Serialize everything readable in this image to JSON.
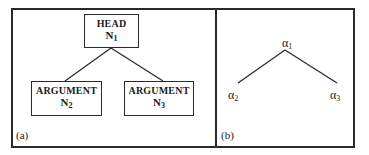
{
  "panel_a": {
    "label": "(a)",
    "head": {
      "title": "HEAD",
      "node": "N",
      "sub": "1"
    },
    "arguments": [
      {
        "title": "ARGUMENT",
        "node": "N",
        "sub": "2"
      },
      {
        "title": "ARGUMENT",
        "node": "N",
        "sub": "3"
      }
    ]
  },
  "panel_b": {
    "label": "(b)",
    "root": {
      "symbol": "α",
      "sub": "1"
    },
    "children": [
      {
        "symbol": "α",
        "sub": "2"
      },
      {
        "symbol": "α",
        "sub": "3"
      }
    ]
  }
}
